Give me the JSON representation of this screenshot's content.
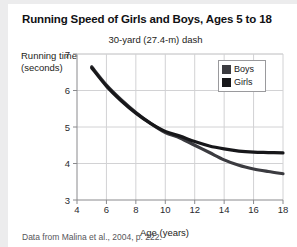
{
  "figure": {
    "title": "Running Speed of Girls and Boys, Ages 5 to 18",
    "subtitle": "30-yard (27.4-m) dash",
    "source": "Data from Malina et al., 2004, p. 222.",
    "y_axis_title_line1": "Running time",
    "y_axis_title_line2": "(seconds)",
    "x_axis_title": "Age (years)"
  },
  "colors": {
    "background": "#ececed",
    "card": "#ffffff",
    "boys_line": "#3b3b40",
    "girls_line": "#17171a",
    "gridline": "#d2d2d4",
    "axis": "#8a8a8d",
    "title_text": "#111114",
    "caption_text": "#56565a"
  },
  "chart_data": {
    "type": "line",
    "title": "Running Speed of Girls and Boys, Ages 5 to 18",
    "subtitle": "30-yard (27.4-m) dash",
    "xlabel": "Age (years)",
    "ylabel": "Running time (seconds)",
    "xlim": [
      4,
      18
    ],
    "ylim": [
      3,
      7
    ],
    "xticks": [
      4,
      6,
      8,
      10,
      12,
      14,
      16,
      18
    ],
    "yticks": [
      3,
      4,
      5,
      6,
      7
    ],
    "grid": true,
    "legend_position": "top-right",
    "x": [
      5,
      6,
      7,
      8,
      9,
      10,
      11,
      12,
      13,
      14,
      15,
      16,
      17,
      18
    ],
    "series": [
      {
        "name": "Boys",
        "values": [
          6.65,
          6.15,
          5.75,
          5.4,
          5.1,
          4.85,
          4.7,
          4.5,
          4.3,
          4.1,
          3.95,
          3.85,
          3.78,
          3.72
        ]
      },
      {
        "name": "Girls",
        "values": [
          6.62,
          6.12,
          5.72,
          5.38,
          5.1,
          4.88,
          4.75,
          4.6,
          4.48,
          4.4,
          4.34,
          4.31,
          4.3,
          4.29
        ]
      }
    ]
  },
  "legend": {
    "items": [
      {
        "label": "Boys",
        "color": "#3b3b40"
      },
      {
        "label": "Girls",
        "color": "#17171a"
      }
    ]
  }
}
